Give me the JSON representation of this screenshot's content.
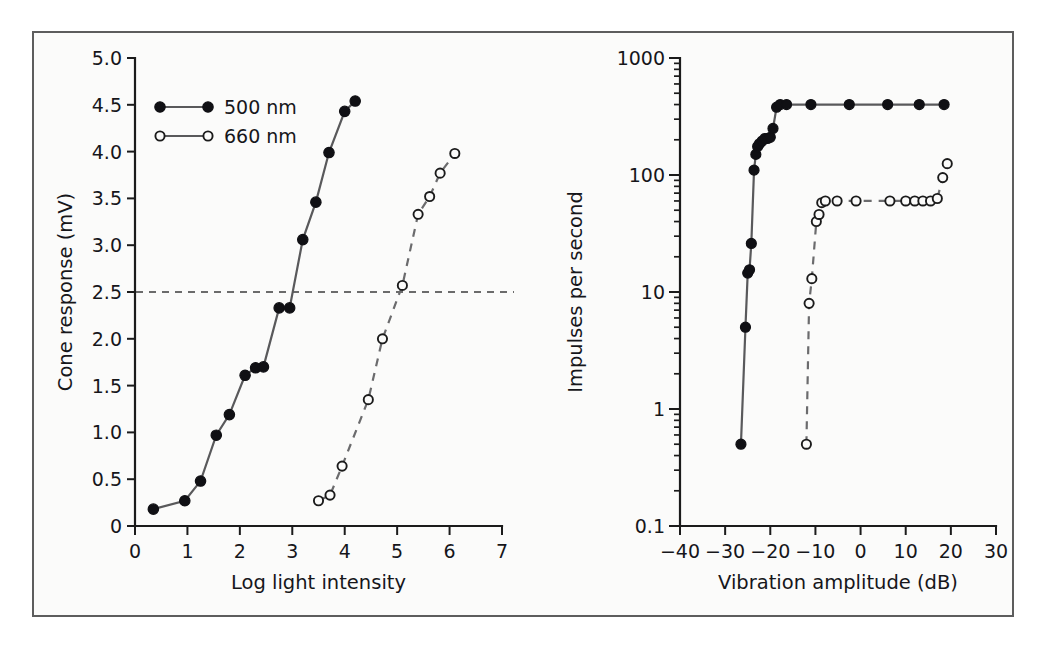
{
  "figure": {
    "background_color": "#fbfbfa",
    "frame_color": "#5d5d5d",
    "page_color": "#ffffff"
  },
  "chart_data": [
    {
      "id": "cone-response",
      "type": "line",
      "title": "",
      "xlabel": "Log light intensity",
      "ylabel": "Cone response (mV)",
      "xlim": [
        0,
        7
      ],
      "ylim": [
        0,
        5.0
      ],
      "xticks": [
        "0",
        "1",
        "2",
        "3",
        "4",
        "5",
        "6",
        "7"
      ],
      "xtick_values": [
        0,
        1,
        2,
        3,
        4,
        5,
        6,
        7
      ],
      "yticks": [
        "0",
        "0.5",
        "1.0",
        "1.5",
        "2.0",
        "2.5",
        "3.0",
        "3.5",
        "4.0",
        "4.5",
        "5.0"
      ],
      "ytick_values": [
        0,
        0.5,
        1.0,
        1.5,
        2.0,
        2.5,
        3.0,
        3.5,
        4.0,
        4.5,
        5.0
      ],
      "grid": false,
      "legend_position": "upper-left-inside",
      "annotations": [
        {
          "name": "half-max-reference-line",
          "type": "hline",
          "y": 2.5,
          "style": "dashed"
        }
      ],
      "series": [
        {
          "name": "500 nm",
          "marker": "filled-circle",
          "line": "solid",
          "color": "#101014",
          "x": [
            0.35,
            0.95,
            1.25,
            1.55,
            1.8,
            2.1,
            2.3,
            2.45,
            2.75,
            2.95,
            3.2,
            3.45,
            3.7,
            4.0,
            4.2
          ],
          "y": [
            0.18,
            0.27,
            0.48,
            0.97,
            1.19,
            1.61,
            1.69,
            1.7,
            2.33,
            2.33,
            3.06,
            3.46,
            3.99,
            4.43,
            4.54
          ]
        },
        {
          "name": "660 nm",
          "marker": "open-circle",
          "line": "dashed",
          "color": "#1b1b1b",
          "x": [
            3.5,
            3.72,
            3.95,
            4.45,
            4.72,
            5.1,
            5.4,
            5.62,
            5.82,
            6.1
          ],
          "y": [
            0.27,
            0.33,
            0.64,
            1.35,
            2.0,
            2.57,
            3.33,
            3.52,
            3.77,
            3.98
          ]
        }
      ]
    },
    {
      "id": "impulses-vibration",
      "type": "line",
      "title": "",
      "xlabel": "Vibration amplitude (dB)",
      "ylabel": "Impulses per second",
      "xlim": [
        -40,
        30
      ],
      "ylim": [
        0.1,
        1000
      ],
      "yscale": "log",
      "xticks": [
        "−40",
        "−30",
        "−20",
        "−10",
        "0",
        "10",
        "20",
        "30"
      ],
      "xtick_values": [
        -40,
        -30,
        -20,
        -10,
        0,
        10,
        20,
        30
      ],
      "yticks": [
        "0.1",
        "1",
        "10",
        "100",
        "1000"
      ],
      "ytick_values": [
        0.1,
        1,
        10,
        100,
        1000
      ],
      "grid": false,
      "legend_position": "none",
      "series": [
        {
          "name": "filled-circle-series",
          "marker": "filled-circle",
          "line": "solid",
          "color": "#101014",
          "x": [
            -26.5,
            -25.5,
            -25.0,
            -24.6,
            -24.2,
            -23.6,
            -23.2,
            -22.8,
            -22.4,
            -21.8,
            -21.2,
            -20.6,
            -20.0,
            -19.4,
            -18.6,
            -17.8,
            -16.4,
            -11.0,
            -2.5,
            6.0,
            13.0,
            18.5
          ],
          "y": [
            0.5,
            5.0,
            14.5,
            15.5,
            26.0,
            110.0,
            150.0,
            175.0,
            185.0,
            195.0,
            205.0,
            205.0,
            210.0,
            250.0,
            380.0,
            400.0,
            400.0,
            400.0,
            400.0,
            400.0,
            400.0,
            400.0
          ]
        },
        {
          "name": "open-circle-series",
          "marker": "open-circle",
          "line": "dashed",
          "color": "#1b1b1b",
          "x": [
            -12.0,
            -11.4,
            -10.8,
            -9.8,
            -9.2,
            -8.6,
            -7.8,
            -5.2,
            -1.0,
            6.5,
            10.0,
            12.0,
            13.8,
            15.5,
            17.0,
            18.2,
            19.2
          ],
          "y": [
            0.5,
            8.0,
            13.0,
            40.0,
            46.0,
            58.0,
            60.0,
            60.0,
            60.0,
            60.0,
            60.0,
            60.0,
            60.0,
            60.0,
            63.0,
            95.0,
            125.0
          ]
        }
      ]
    }
  ],
  "legend": {
    "items": [
      {
        "label": "500 nm",
        "marker": "filled-circle"
      },
      {
        "label": "660 nm",
        "marker": "open-circle"
      }
    ]
  }
}
